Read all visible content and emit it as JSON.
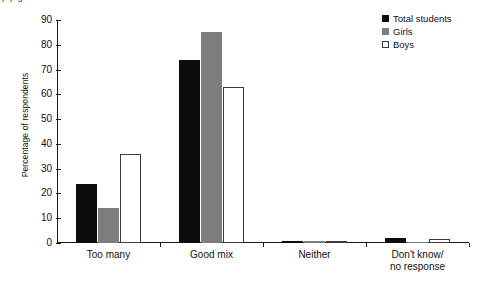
{
  "top_fragment": "p p                                    g",
  "chart_data": {
    "type": "bar",
    "title": "",
    "xlabel": "",
    "ylabel": "Percentage of respondents",
    "ylim": [
      0,
      90
    ],
    "yticks": [
      0,
      10,
      20,
      30,
      40,
      50,
      60,
      70,
      80,
      90
    ],
    "grid": false,
    "legend_position": "top-right",
    "categories": [
      "Too many",
      "Good mix",
      "Neither",
      "Don't know/\nno response"
    ],
    "series": [
      {
        "name": "Total students",
        "color": "#0d0d0d",
        "values": [
          24,
          74,
          1,
          2
        ]
      },
      {
        "name": "Girls",
        "color": "#7d7d7d",
        "values": [
          14,
          85,
          1,
          0.3
        ]
      },
      {
        "name": "Boys",
        "color": "#ffffff",
        "values": [
          36,
          63,
          0.5,
          1.5
        ]
      }
    ]
  },
  "legend": {
    "items": [
      {
        "label": "Total students",
        "swatch": "total"
      },
      {
        "label": "Girls",
        "swatch": "girls"
      },
      {
        "label": "Boys",
        "swatch": "boys"
      }
    ]
  }
}
